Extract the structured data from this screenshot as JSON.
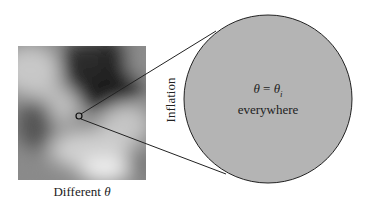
{
  "diagram": {
    "left_panel": {
      "caption_text": "Different ",
      "caption_symbol": "θ",
      "description": "grayscale random field map"
    },
    "arrow_label": "Inflation",
    "circle": {
      "line1_lhs": "θ",
      "line1_eq": " = ",
      "line1_rhs": "θ",
      "line1_sub": "i",
      "line2": "everywhere",
      "fill_color": "#b4b4b4"
    }
  }
}
